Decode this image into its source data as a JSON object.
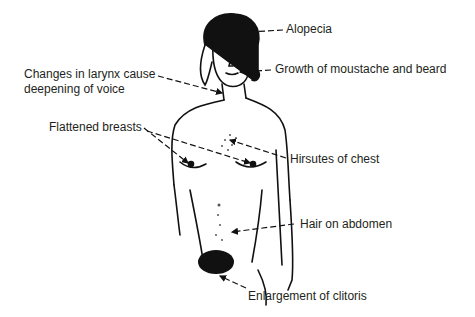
{
  "figure": {
    "labels": {
      "alopecia": "Alopecia",
      "moustache": "Growth of moustache and beard",
      "larynx_line1": "Changes in larynx cause",
      "larynx_line2": "deepening of voice",
      "breasts": "Flattened breasts",
      "chest": "Hirsutes of chest",
      "abdomen": "Hair on abdomen",
      "clitoris": "Enlargement of clitoris"
    }
  }
}
